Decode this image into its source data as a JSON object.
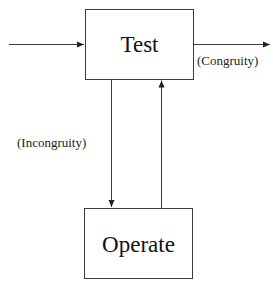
{
  "diagram": {
    "nodes": [
      {
        "id": "test",
        "label": "Test"
      },
      {
        "id": "operate",
        "label": "Operate"
      }
    ],
    "edges": [
      {
        "from": "input",
        "to": "test",
        "label": ""
      },
      {
        "from": "test",
        "to": "output",
        "label": "(Congruity)"
      },
      {
        "from": "test",
        "to": "operate",
        "label": "(Incongruity)"
      },
      {
        "from": "operate",
        "to": "test",
        "label": ""
      }
    ],
    "labels": {
      "test": "Test",
      "operate": "Operate",
      "congruity": "(Congruity)",
      "incongruity": "(Incongruity)"
    }
  }
}
